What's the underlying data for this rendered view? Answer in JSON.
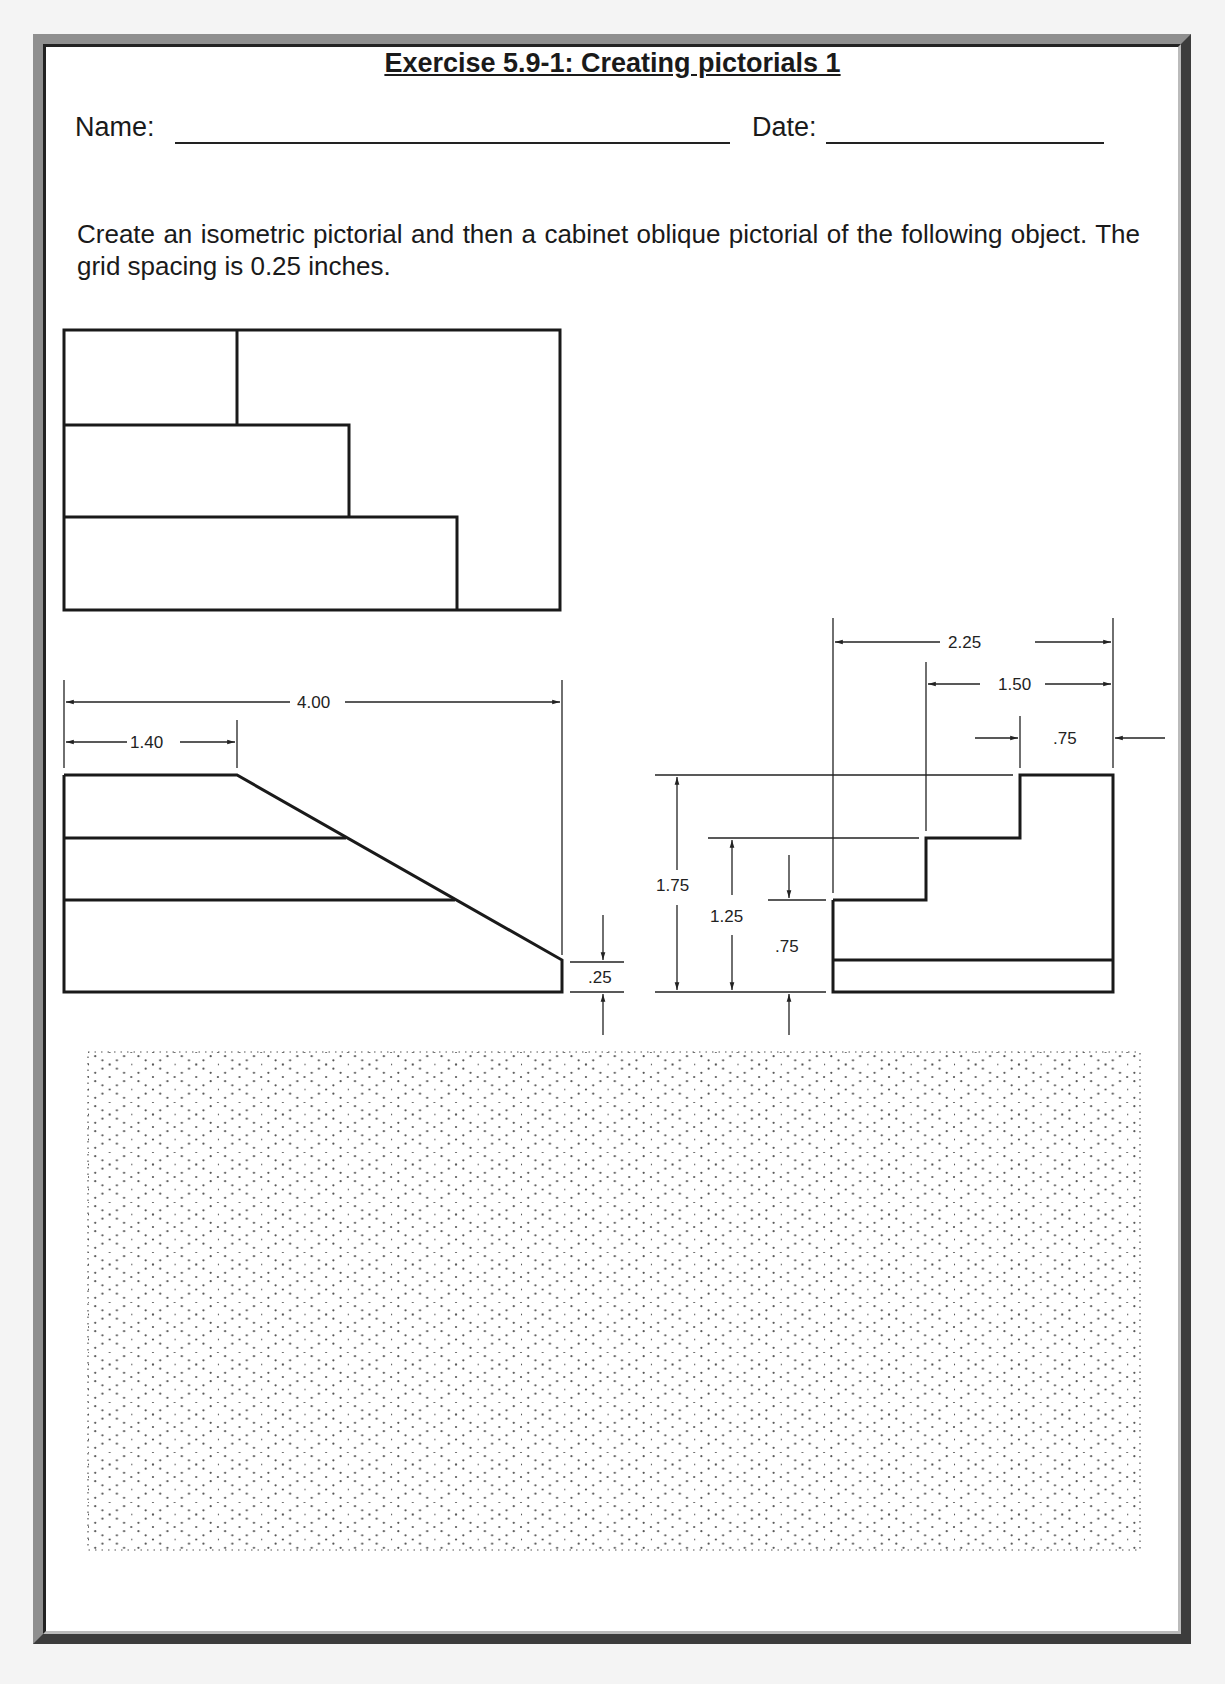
{
  "document": {
    "title": "Exercise 5.9-1:  Creating pictorials 1",
    "name_label": "Name:",
    "date_label": "Date:",
    "instructions": "Create an isometric pictorial and then a cabinet oblique pictorial of the following object.  The grid spacing is 0.25 inches."
  },
  "top_view": {
    "label": "top-view"
  },
  "front_view": {
    "dimensions": {
      "overall_width": "4.00",
      "top_width": "1.40",
      "end_height": ".25"
    }
  },
  "side_view": {
    "dimensions": {
      "overall_depth": "2.25",
      "mid_depth": "1.50",
      "top_step_depth": ".75",
      "overall_height": "1.75",
      "mid_height": "1.25",
      "low_height": ".75"
    }
  },
  "grid": {
    "type": "isometric dot grid",
    "spacing": "0.25 inches"
  },
  "colors": {
    "ink": "#1a1a1a",
    "frame_light": "#8f8f8f",
    "frame_dark": "#3c3c3c",
    "paper": "#ffffff"
  }
}
